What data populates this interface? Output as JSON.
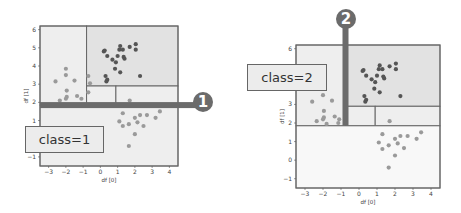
{
  "colors": {
    "frame": "#666666",
    "region_light": "#eeeeee",
    "region_mid": "#e2e2e2",
    "region_white": "#f8f8f8",
    "split_bar": "#6b6b6b",
    "point_dark": "#555555",
    "point_light": "#9a9a9a"
  },
  "chart_data": [
    {
      "type": "scatter",
      "title": "",
      "xlabel": "df [0]",
      "ylabel": "df [1]",
      "xlim": [
        -3.5,
        4.5
      ],
      "ylim": [
        -1.5,
        6.2
      ],
      "xticks": [
        -3,
        -2,
        -1,
        0,
        1,
        2,
        3,
        4
      ],
      "yticks": [
        -1,
        0,
        1,
        2,
        3,
        4,
        5,
        6
      ],
      "grid": false,
      "annotation": {
        "label": "class=1",
        "badge": "1",
        "split": "horizontal",
        "split_value": 1.85
      },
      "regions": [
        {
          "x0": -3.5,
          "x1": -0.8,
          "y0": 1.85,
          "y1": 6.2,
          "shade": "light"
        },
        {
          "x0": -0.8,
          "x1": 4.5,
          "y0": 2.9,
          "y1": 6.2,
          "shade": "mid"
        },
        {
          "x0": -0.8,
          "x1": 0.9,
          "y0": 1.85,
          "y1": 2.9,
          "shade": "light"
        },
        {
          "x0": 0.9,
          "x1": 4.5,
          "y0": 1.85,
          "y1": 2.9,
          "shade": "light"
        },
        {
          "x0": -3.5,
          "x1": 4.5,
          "y0": -1.5,
          "y1": 1.85,
          "shade": "light"
        }
      ],
      "series": [
        {
          "name": "cluster_top_right",
          "shade": "dark",
          "points": [
            [
              0.2,
              4.8
            ],
            [
              0.25,
              4.85
            ],
            [
              0.4,
              4.55
            ],
            [
              0.7,
              4.35
            ],
            [
              0.9,
              4.2
            ],
            [
              1.0,
              4.55
            ],
            [
              1.1,
              4.9
            ],
            [
              1.15,
              5.1
            ],
            [
              1.3,
              4.9
            ],
            [
              1.35,
              4.5
            ],
            [
              1.4,
              4.4
            ],
            [
              1.7,
              5.05
            ],
            [
              2.05,
              5.2
            ],
            [
              2.05,
              4.9
            ],
            [
              0.85,
              3.85
            ],
            [
              1.15,
              3.65
            ],
            [
              0.3,
              3.45
            ],
            [
              0.4,
              3.25
            ],
            [
              0.35,
              3.15
            ],
            [
              2.3,
              3.45
            ]
          ]
        },
        {
          "name": "cluster_left",
          "shade": "light",
          "points": [
            [
              -2.6,
              3.15
            ],
            [
              -2.0,
              3.85
            ],
            [
              -2.0,
              3.5
            ],
            [
              -1.5,
              3.2
            ],
            [
              -1.95,
              2.65
            ],
            [
              -2.35,
              2.1
            ],
            [
              -2.0,
              2.2
            ],
            [
              -1.95,
              2.3
            ],
            [
              -1.35,
              2.35
            ],
            [
              -1.1,
              2.2
            ],
            [
              -0.7,
              2.55
            ],
            [
              -0.7,
              3.45
            ],
            [
              -0.6,
              3.05
            ]
          ]
        },
        {
          "name": "cluster_bottom_right",
          "shade": "light",
          "points": [
            [
              1.7,
              2.1
            ],
            [
              1.3,
              1.4
            ],
            [
              1.1,
              0.95
            ],
            [
              1.3,
              0.7
            ],
            [
              1.65,
              0.8
            ],
            [
              2.0,
              1.15
            ],
            [
              2.15,
              0.9
            ],
            [
              2.3,
              1.3
            ],
            [
              2.5,
              0.7
            ],
            [
              2.7,
              1.3
            ],
            [
              3.2,
              1.15
            ],
            [
              3.45,
              1.5
            ],
            [
              2.0,
              0.25
            ],
            [
              1.65,
              -0.4
            ]
          ]
        }
      ]
    },
    {
      "type": "scatter",
      "title": "",
      "xlabel": "df [0]",
      "ylabel": "df [1]",
      "xlim": [
        -3.5,
        4.5
      ],
      "ylim": [
        -1.5,
        6.2
      ],
      "xticks": [
        -3,
        -2,
        -1,
        0,
        1,
        2,
        3,
        4
      ],
      "yticks": [
        -1,
        0,
        1,
        2,
        3,
        4,
        5,
        6
      ],
      "grid": false,
      "annotation": {
        "label": "class=2",
        "badge": "2",
        "split": "vertical",
        "split_value": -0.75
      },
      "regions": [
        {
          "x0": -3.5,
          "x1": -0.75,
          "y0": 1.85,
          "y1": 6.2,
          "shade": "light"
        },
        {
          "x0": -0.75,
          "x1": 4.5,
          "y0": 2.9,
          "y1": 6.2,
          "shade": "mid"
        },
        {
          "x0": -0.75,
          "x1": 0.9,
          "y0": 1.85,
          "y1": 2.9,
          "shade": "light"
        },
        {
          "x0": 0.9,
          "x1": 4.5,
          "y0": 1.85,
          "y1": 2.9,
          "shade": "light"
        },
        {
          "x0": -3.5,
          "x1": 4.5,
          "y0": -1.5,
          "y1": 1.85,
          "shade": "white"
        }
      ],
      "series": [
        {
          "name": "cluster_top_right",
          "shade": "dark",
          "points": [
            [
              0.2,
              4.8
            ],
            [
              0.25,
              4.85
            ],
            [
              0.4,
              4.55
            ],
            [
              0.7,
              4.35
            ],
            [
              0.9,
              4.2
            ],
            [
              1.0,
              4.55
            ],
            [
              1.1,
              4.9
            ],
            [
              1.15,
              5.1
            ],
            [
              1.3,
              4.9
            ],
            [
              1.35,
              4.5
            ],
            [
              1.4,
              4.4
            ],
            [
              1.7,
              5.05
            ],
            [
              2.05,
              5.2
            ],
            [
              2.05,
              4.9
            ],
            [
              0.85,
              3.85
            ],
            [
              1.15,
              3.65
            ],
            [
              0.3,
              3.45
            ],
            [
              0.4,
              3.25
            ],
            [
              0.35,
              3.15
            ],
            [
              2.3,
              3.45
            ]
          ]
        },
        {
          "name": "cluster_left",
          "shade": "light",
          "points": [
            [
              -2.6,
              3.15
            ],
            [
              -2.0,
              3.5
            ],
            [
              -1.5,
              3.2
            ],
            [
              -1.95,
              2.65
            ],
            [
              -2.35,
              2.1
            ],
            [
              -2.0,
              2.2
            ],
            [
              -1.95,
              2.3
            ],
            [
              -1.35,
              2.35
            ],
            [
              -1.1,
              2.2
            ],
            [
              -1.8,
              1.95
            ],
            [
              -1.15,
              2.0
            ]
          ]
        },
        {
          "name": "cluster_bottom_right",
          "shade": "light",
          "points": [
            [
              1.7,
              2.1
            ],
            [
              1.3,
              1.4
            ],
            [
              1.1,
              0.95
            ],
            [
              1.3,
              0.6
            ],
            [
              1.65,
              0.8
            ],
            [
              2.0,
              1.15
            ],
            [
              2.15,
              0.9
            ],
            [
              2.3,
              1.3
            ],
            [
              2.5,
              0.65
            ],
            [
              2.7,
              1.3
            ],
            [
              3.2,
              1.15
            ],
            [
              3.45,
              1.5
            ],
            [
              2.0,
              0.25
            ],
            [
              1.65,
              -0.4
            ]
          ]
        }
      ]
    }
  ],
  "panels": [
    {
      "frame": {
        "left": 40,
        "top": 26,
        "right": 178,
        "bottom": 166
      }
    },
    {
      "frame": {
        "left": 296,
        "top": 45,
        "right": 440,
        "bottom": 188
      }
    }
  ],
  "labels": {
    "panel1_class": "class=1",
    "panel1_badge": "1",
    "panel2_class": "class=2",
    "panel2_badge": "2"
  }
}
